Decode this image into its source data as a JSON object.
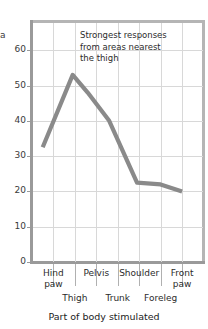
{
  "chart_data": {
    "type": "line",
    "title": "",
    "xlabel": "Part of body stimulated",
    "ylabel": "a",
    "ylim": [
      0,
      68
    ],
    "yticks": [
      0,
      10,
      20,
      30,
      40,
      50,
      60
    ],
    "grid": true,
    "legend": null,
    "categories": [
      "Hind paw",
      "Thigh",
      "Pelvis",
      "Trunk",
      "Shoulder",
      "Foreleg",
      "Front paw"
    ],
    "x_labels_upper": [
      "Hind paw",
      "Pelvis",
      "Shoulder",
      "Front paw"
    ],
    "x_labels_lower": [
      "Thigh",
      "Trunk",
      "Foreleg"
    ],
    "values": [
      32.5,
      53,
      48,
      40,
      22.5,
      22,
      20
    ],
    "annotations": [
      {
        "text": "Strongest responses\nfrom areas nearest\nthe thigh"
      }
    ],
    "line_color": "#8a8a8a",
    "grid_color": "#d8d8d8",
    "axis_color": "#9a9a9a"
  },
  "ytick_labels": [
    "60",
    "50",
    "40",
    "30",
    "20",
    "10",
    "0"
  ],
  "x_upper": [
    {
      "label_line1": "Hind",
      "label_line2": "paw"
    },
    {
      "label_line1": "Pelvis",
      "label_line2": ""
    },
    {
      "label_line1": "Shoulder",
      "label_line2": ""
    },
    {
      "label_line1": "Front",
      "label_line2": "paw"
    }
  ],
  "x_lower": [
    "Thigh",
    "Trunk",
    "Foreleg"
  ],
  "axis_title": "Part of body stimulated",
  "ylabel_clip": "a",
  "annotation": "Strongest responses\nfrom areas nearest\nthe thigh"
}
